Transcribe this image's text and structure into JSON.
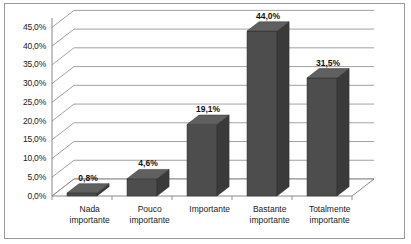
{
  "chart_data": {
    "type": "bar",
    "title": "",
    "subtitle": "",
    "xlabel": "",
    "ylabel": "",
    "categories": [
      "Nada importante",
      "Pouco importante",
      "Importante",
      "Bastante importante",
      "Totalmente importante"
    ],
    "category_lines": [
      [
        "Nada",
        "importante"
      ],
      [
        "Pouco",
        "importante"
      ],
      [
        "Importante",
        ""
      ],
      [
        "Bastante",
        "importante"
      ],
      [
        "Totalmente",
        "importante"
      ]
    ],
    "values": [
      0.8,
      4.6,
      19.1,
      44.0,
      31.5
    ],
    "data_labels": [
      "0,8%",
      "4,6%",
      "19,1%",
      "44,0%",
      "31,5%"
    ],
    "ylim": [
      0,
      47.5
    ],
    "ytick_values": [
      0,
      5,
      10,
      15,
      20,
      25,
      30,
      35,
      40,
      45
    ],
    "ytick_labels": [
      "0,0%",
      "5,0%",
      "10,0%",
      "15,0%",
      "20,0%",
      "25,0%",
      "30,0%",
      "35,0%",
      "40,0%",
      "45,0%"
    ],
    "grid": true,
    "legend": "none",
    "style": "3d-column",
    "colors": {
      "bar_front": "#4d4d4d",
      "bar_side": "#3a3a3a",
      "bar_top": "#606060",
      "gridline": "#8a8a8a",
      "axis": "#7a7a7a",
      "floor": "#ffffff",
      "border": "#9a9a9a",
      "text": "#1a1a1a"
    }
  }
}
